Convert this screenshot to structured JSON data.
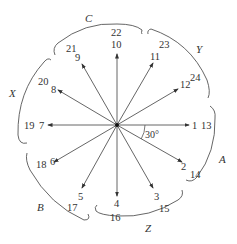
{
  "diagram": {
    "type": "phasor-star",
    "center": [
      117,
      125
    ],
    "angle_label": "30°",
    "arrows": [
      {
        "inner": "1",
        "outer": "13",
        "angle_deg": 0
      },
      {
        "inner": "2",
        "outer": "14",
        "angle_deg": -30
      },
      {
        "inner": "3",
        "outer": "15",
        "angle_deg": -60
      },
      {
        "inner": "4",
        "outer": "16",
        "angle_deg": -90
      },
      {
        "inner": "5",
        "outer": "17",
        "angle_deg": -120
      },
      {
        "inner": "6",
        "outer": "18",
        "angle_deg": -150
      },
      {
        "inner": "7",
        "outer": "19",
        "angle_deg": 180
      },
      {
        "inner": "8",
        "outer": "20",
        "angle_deg": 150
      },
      {
        "inner": "9",
        "outer": "21",
        "angle_deg": 120
      },
      {
        "inner": "10",
        "outer": "22",
        "angle_deg": 90
      },
      {
        "inner": "11",
        "outer": "23",
        "angle_deg": 60
      },
      {
        "inner": "12",
        "outer": "24",
        "angle_deg": 30
      }
    ],
    "groups": [
      {
        "label": "A"
      },
      {
        "label": "Z"
      },
      {
        "label": "B"
      },
      {
        "label": "X"
      },
      {
        "label": "C"
      },
      {
        "label": "Y"
      }
    ]
  }
}
